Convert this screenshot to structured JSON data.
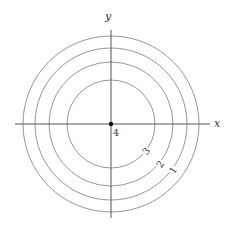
{
  "diagram": {
    "type": "contour-plot",
    "center": {
      "x": 111,
      "y": 124
    },
    "axes": {
      "x": {
        "label": "x",
        "from": 15,
        "to": 210
      },
      "y": {
        "label": "y",
        "from": 30,
        "to": 218
      }
    },
    "contours": [
      {
        "level": "1",
        "radius": 88
      },
      {
        "level": "2",
        "radius": 76
      },
      {
        "level": "3",
        "radius": 62
      },
      {
        "level": "4",
        "radius": 44
      }
    ],
    "contour_labels": [
      {
        "text": "3",
        "x": 146,
        "y": 151,
        "rotate": -52
      },
      {
        "text": "2",
        "x": 160,
        "y": 164,
        "rotate": -55
      },
      {
        "text": "1",
        "x": 173,
        "y": 170,
        "rotate": -58
      }
    ],
    "center_point": {
      "label": "4"
    },
    "colors": {
      "axis": "#555555",
      "contour": "#8a8a8a",
      "text": "#333333"
    }
  }
}
